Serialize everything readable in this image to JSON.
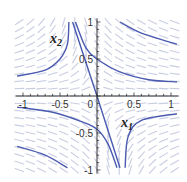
{
  "chart_data": {
    "type": "line",
    "subtype": "phase-portrait",
    "title": "",
    "xlabel": "x1",
    "ylabel": "x2",
    "xlim": [
      -1.1,
      1.1
    ],
    "ylim": [
      -1.05,
      1.05
    ],
    "grid": false,
    "legend": null,
    "x_ticks": [
      {
        "value": -1,
        "label": "-1"
      },
      {
        "value": -0.5,
        "label": "-0.5"
      },
      {
        "value": 0.5,
        "label": "0.5"
      },
      {
        "value": 1,
        "label": "1"
      }
    ],
    "y_ticks": [
      {
        "value": 1,
        "label": "1"
      },
      {
        "value": 0.5,
        "label": "0.5"
      },
      {
        "value": -0.5,
        "label": "-0.5"
      },
      {
        "value": -1,
        "label": "-1"
      }
    ],
    "origin_label": "0",
    "colors": {
      "trajectory": "#4a5ab0",
      "vector_field": "#c9cde2",
      "axis": "#333333"
    },
    "series": [
      {
        "name": "separatrix-line",
        "points": [
          [
            -0.33,
            1.0
          ],
          [
            0.0,
            0.0
          ],
          [
            0.31,
            -0.97
          ]
        ]
      },
      {
        "name": "trajectory-top-left",
        "points": [
          [
            -1.08,
            0.27
          ],
          [
            -0.7,
            0.35
          ],
          [
            -0.5,
            0.5
          ],
          [
            -0.4,
            0.7
          ],
          [
            -0.38,
            1.0
          ]
        ]
      },
      {
        "name": "trajectory-top-right-upper",
        "points": [
          [
            0.31,
            1.0
          ],
          [
            0.6,
            0.85
          ],
          [
            1.08,
            0.7
          ]
        ]
      },
      {
        "name": "trajectory-through-upper",
        "points": [
          [
            -0.29,
            1.0
          ],
          [
            -0.15,
            0.65
          ],
          [
            0.0,
            0.5
          ],
          [
            0.3,
            0.33
          ],
          [
            0.7,
            0.22
          ],
          [
            1.08,
            0.19
          ]
        ]
      },
      {
        "name": "trajectory-through-lower",
        "points": [
          [
            -1.08,
            -0.15
          ],
          [
            -0.6,
            -0.22
          ],
          [
            -0.2,
            -0.35
          ],
          [
            0.0,
            -0.45
          ],
          [
            0.15,
            -0.65
          ],
          [
            0.27,
            -0.97
          ]
        ]
      },
      {
        "name": "trajectory-bottom-left",
        "points": [
          [
            -1.08,
            -0.68
          ],
          [
            -0.7,
            -0.8
          ],
          [
            -0.4,
            -0.97
          ]
        ]
      },
      {
        "name": "trajectory-bottom-right",
        "points": [
          [
            0.38,
            -0.97
          ],
          [
            0.42,
            -0.55
          ],
          [
            0.6,
            -0.33
          ],
          [
            1.08,
            -0.24
          ]
        ]
      }
    ],
    "annotations": [
      {
        "text": "x2",
        "subscript": "2",
        "at": [
          -0.65,
          0.8
        ]
      },
      {
        "text": "x1",
        "subscript": "1",
        "at": [
          0.33,
          -0.38
        ]
      }
    ]
  },
  "labels": {
    "x_axis_main": "x",
    "x_axis_sub": "1",
    "y_axis_main": "x",
    "y_axis_sub": "2",
    "origin": "0"
  }
}
